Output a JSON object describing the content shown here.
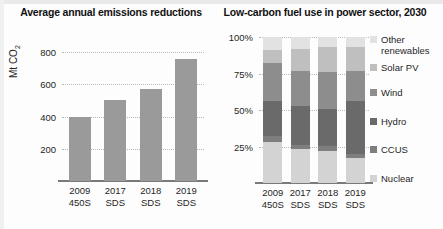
{
  "charts": {
    "left": {
      "title": "Average annual emissions reductions",
      "ylabel_main": "Mt CO",
      "ylabel_sub": "2",
      "yticks": [
        "800",
        "600",
        "400",
        "200"
      ],
      "categories": [
        {
          "line1": "2009",
          "line2": "450S"
        },
        {
          "line1": "2017",
          "line2": "SDS"
        },
        {
          "line1": "2018",
          "line2": "SDS"
        },
        {
          "line1": "2019",
          "line2": "SDS"
        }
      ]
    },
    "right": {
      "title": "Low-carbon fuel use in power sector, 2030",
      "yticks": [
        "100%",
        "75%",
        "50%",
        "25%"
      ],
      "categories": [
        {
          "line1": "2009",
          "line2": "450S"
        },
        {
          "line1": "2017",
          "line2": "SDS"
        },
        {
          "line1": "2018",
          "line2": "SDS"
        },
        {
          "line1": "2019",
          "line2": "SDS"
        }
      ],
      "legend": [
        {
          "label": "Other renewables",
          "color": "#e2e2e2"
        },
        {
          "label": "Solar PV",
          "color": "#bfbfbf"
        },
        {
          "label": "Wind",
          "color": "#8d8d8d"
        },
        {
          "label": "Hydro",
          "color": "#6a6a6a"
        },
        {
          "label": "CCUS",
          "color": "#7e7e7e"
        },
        {
          "label": "Nuclear",
          "color": "#d3d3d3"
        }
      ]
    }
  },
  "chart_data": [
    {
      "type": "bar",
      "title": "Average annual emissions reductions",
      "xlabel": "",
      "ylabel": "Mt CO2",
      "ylim": [
        0,
        900
      ],
      "yticks": [
        200,
        400,
        600,
        800
      ],
      "grid": true,
      "bar_color": "#9a9a9a",
      "categories": [
        "2009 450S",
        "2017 SDS",
        "2018 SDS",
        "2019 SDS"
      ],
      "values": [
        400,
        505,
        570,
        760
      ]
    },
    {
      "type": "bar",
      "subtype": "stacked-100-percent",
      "title": "Low-carbon fuel use in power sector, 2030",
      "xlabel": "",
      "ylabel": "",
      "ylim": [
        0,
        100
      ],
      "yticks": [
        25,
        50,
        75,
        100
      ],
      "ytick_labels": [
        "25%",
        "50%",
        "75%",
        "100%"
      ],
      "grid": true,
      "legend_position": "right",
      "categories": [
        "2009 450S",
        "2017 SDS",
        "2018 SDS",
        "2019 SDS"
      ],
      "series": [
        {
          "name": "Other renewables",
          "color": "#e2e2e2",
          "values": [
            9,
            8,
            7,
            7
          ]
        },
        {
          "name": "Solar PV",
          "color": "#bfbfbf",
          "values": [
            9,
            15,
            17,
            16
          ]
        },
        {
          "name": "Wind",
          "color": "#8d8d8d",
          "values": [
            26,
            24,
            25,
            21
          ]
        },
        {
          "name": "Hydro",
          "color": "#6a6a6a",
          "values": [
            24,
            27,
            26,
            36
          ]
        },
        {
          "name": "CCUS",
          "color": "#7e7e7e",
          "values": [
            4,
            3,
            3,
            3
          ]
        },
        {
          "name": "Nuclear",
          "color": "#d3d3d3",
          "values": [
            28,
            23,
            22,
            17
          ]
        }
      ]
    }
  ]
}
